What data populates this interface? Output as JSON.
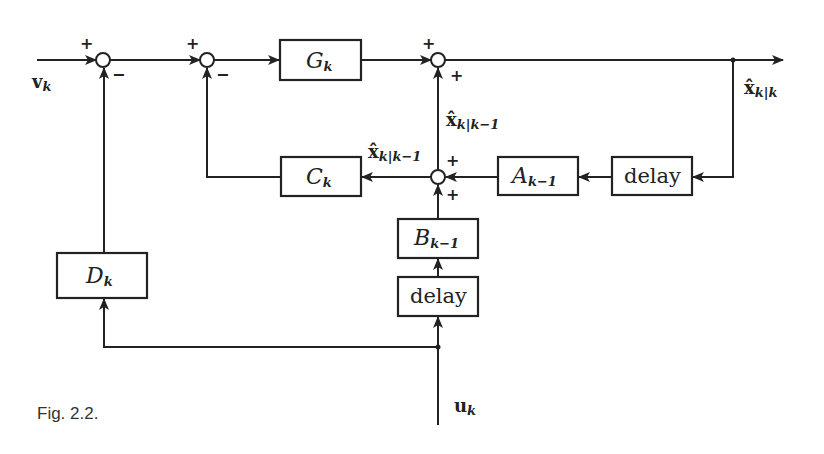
{
  "figure": {
    "caption": "Fig. 2.2.",
    "blocks": {
      "G": {
        "main": "G",
        "sub": "k"
      },
      "C": {
        "main": "C",
        "sub": "k"
      },
      "A": {
        "main": "A",
        "sub": "k−1"
      },
      "B": {
        "main": "B",
        "sub": "k−1"
      },
      "D": {
        "main": "D",
        "sub": "k"
      },
      "delay_top": {
        "text": "delay"
      },
      "delay_bottom": {
        "text": "delay"
      }
    },
    "signals": {
      "v": {
        "main": "v",
        "sub": "k"
      },
      "u": {
        "main": "u",
        "sub": "k"
      },
      "x_kk": {
        "main": "x̂",
        "sub": "k|k"
      },
      "x_pred_vertical": {
        "main": "x̂",
        "sub": "k|k−1"
      },
      "x_pred_left": {
        "main": "x̂",
        "sub": "k|k−1"
      }
    },
    "signs": {
      "sum1_in": "+",
      "sum1_fb": "−",
      "sum2_in": "+",
      "sum2_fb": "−",
      "sum3_in": "+",
      "sum3_fb": "+",
      "sum4_in": "+",
      "sum4_fb": "+"
    }
  }
}
